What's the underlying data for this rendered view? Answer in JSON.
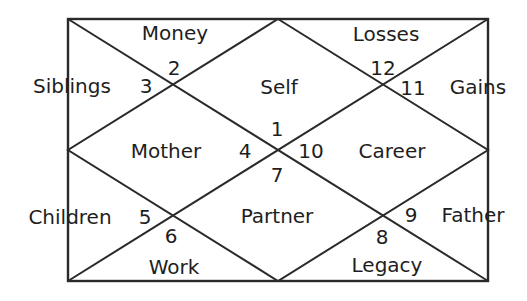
{
  "diagram": {
    "type": "north-indian-horoscope-chart",
    "colors": {
      "line": "#2a2a2a",
      "text": "#1e1e1e",
      "background": "#ffffff"
    },
    "houses": [
      {
        "number": "1",
        "label": "Self"
      },
      {
        "number": "2",
        "label": "Money"
      },
      {
        "number": "3",
        "label": "Siblings"
      },
      {
        "number": "4",
        "label": "Mother"
      },
      {
        "number": "5",
        "label": "Children"
      },
      {
        "number": "6",
        "label": "Work"
      },
      {
        "number": "7",
        "label": "Partner"
      },
      {
        "number": "8",
        "label": "Legacy"
      },
      {
        "number": "9",
        "label": "Father"
      },
      {
        "number": "10",
        "label": "Career"
      },
      {
        "number": "11",
        "label": "Gains"
      },
      {
        "number": "12",
        "label": "Losses"
      }
    ]
  }
}
